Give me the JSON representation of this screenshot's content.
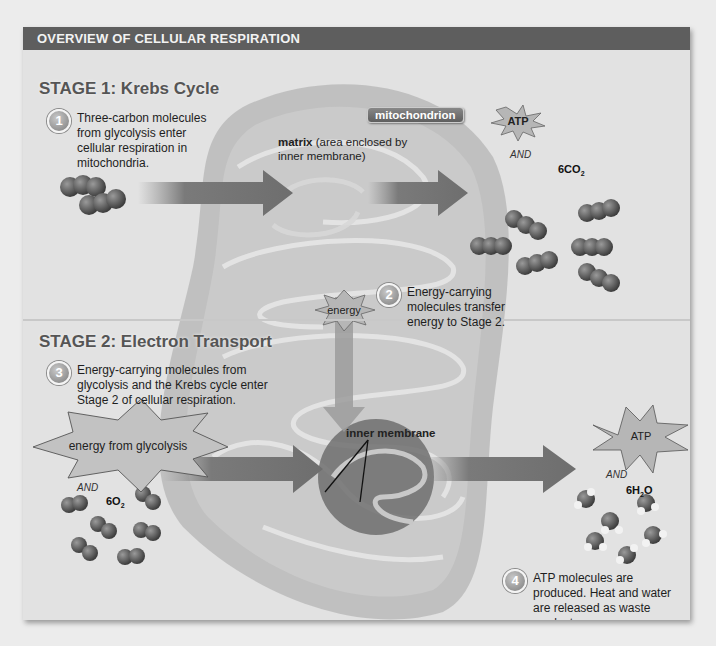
{
  "header": {
    "title": "OVERVIEW OF CELLULAR RESPIRATION"
  },
  "stage1": {
    "title": "STAGE 1: Krebs Cycle",
    "step": {
      "number": "1",
      "text": "Three-carbon molecules from glycolysis enter cellular respiration in mitochondria."
    },
    "matrix_label_bold": "matrix",
    "matrix_label_rest": " (area enclosed by inner membrane)",
    "organelle_tag": "mitochondrion",
    "output_burst": "ATP",
    "and_label": "AND",
    "formula_prefix": "6CO",
    "formula_sub": "2"
  },
  "step2": {
    "number": "2",
    "text": "Energy-carrying molecules transfer energy to Stage 2.",
    "burst": "energy"
  },
  "stage2": {
    "title": "STAGE 2: Electron Transport",
    "step": {
      "number": "3",
      "text": "Energy-carrying molecules from glycolysis and the Krebs cycle enter Stage 2 of cellular respiration."
    },
    "input_burst": "energy from glycolysis",
    "input_and": "AND",
    "input_formula_prefix": "6O",
    "input_formula_sub": "2",
    "membrane_label": "inner membrane",
    "output_burst": "ATP",
    "output_and": "AND",
    "output_formula_prefix": "6H",
    "output_formula_sub": "2",
    "output_formula_suffix": "O",
    "final_step": {
      "number": "4",
      "text": "ATP molecules are produced. Heat and water are released as waste products."
    }
  },
  "colors": {
    "header_bg": "#5e5e5e",
    "panel_bg": "#e2e2e2",
    "mitochondrion": "#b8b8b8",
    "arrow": "#7a7a7a",
    "molecule": "#5a5a5a"
  }
}
